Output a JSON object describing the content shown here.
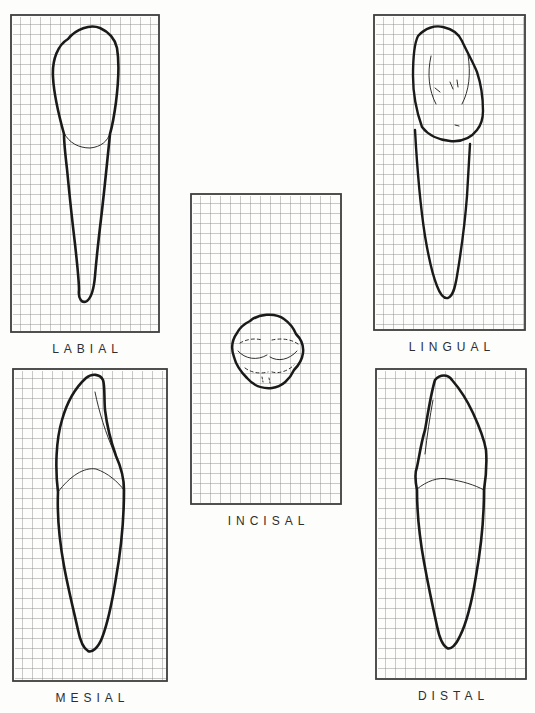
{
  "figure": {
    "background": "#fdfdfc",
    "ink_color": "#1a1a1a",
    "grid_color": "#7a7a7a",
    "border_color": "#3d3d3d",
    "cell_size": 10,
    "grid_stroke": 0.8,
    "border_stroke": 1.8
  },
  "panels": [
    {
      "id": "labial",
      "label": "LABIAL",
      "x": 10,
      "y": 14,
      "w": 150,
      "h": 319,
      "paths": [
        {
          "name": "tooth-outline",
          "d": "M 58 25 C 66 15 80 10 90 14 C 99 18 105 25 107 34 C 110 52 108 72 106 88 C 104 103 102 113 100 120 C 97 150 94 180 91 205 C 88 230 86 250 85 262 C 84 274 82 283 77 287 C 72 290 68 285 69 276 C 69 266 67 248 65 230 C 62 205 59 176 57 155 C 55 138 54 127 54 120 C 49 102 44 82 43 63 C 42 45 48 31 58 25 Z",
          "w": 2.6
        },
        {
          "name": "cervical-line",
          "d": "M 54 119 C 59 129 69 134 80 134 C 91 133 98 127 100 119",
          "w": 0.9
        }
      ]
    },
    {
      "id": "lingual",
      "label": "LINGUAL",
      "x": 373,
      "y": 14,
      "w": 153,
      "h": 317,
      "paths": [
        {
          "name": "crown-outline",
          "d": "M 45 22 C 52 14 62 11 70 13 C 79 15 86 20 89 27 C 94 38 100 48 104 58 C 108 70 110 85 110 97 C 110 104 108 111 104 116 C 98 124 88 128 77 127 C 66 126 55 121 49 113 C 44 99 40 80 40 62 C 40 44 41 30 45 22 Z",
          "w": 2.4
        },
        {
          "name": "root-outline",
          "d": "M 42 116 C 44 152 47 190 52 222 C 56 246 60 262 64 272 C 67 280 71 285 75 284 C 80 282 82 274 84 262 C 88 238 92 208 94 182 C 95 165 96 148 97 130",
          "w": 2.4
        },
        {
          "name": "mesial-marginal-ridge",
          "d": "M 58 42 C 54 60 56 77 63 90",
          "w": 0.9
        },
        {
          "name": "distal-marginal-ridge",
          "d": "M 95 41 C 98 60 96 77 89 90",
          "w": 0.9
        },
        {
          "name": "fossa-marks",
          "d": "M 77 68 L 80 75 M 84 66 L 85 73 M 62 74 L 67 78 M 82 111 L 86 112",
          "w": 0.9
        }
      ]
    },
    {
      "id": "incisal",
      "label": "INCISAL",
      "x": 190,
      "y": 193,
      "w": 152,
      "h": 312,
      "paths": [
        {
          "name": "incisal-outline",
          "d": "M 60 128 C 68 121 85 119 94 126 C 101 131 104 136 106 141 C 111 146 114 152 113 160 C 112 168 108 173 104 177 C 100 186 92 194 82 195 C 72 196 63 192 57 185 C 51 179 46 172 44 164 C 41 156 42 147 47 140 C 50 134 54 131 60 128 Z",
          "w": 2.5
        },
        {
          "name": "incisal-edge-hidden-left",
          "d": "M 50 150 C 57 146 65 145 72 147",
          "w": 0.9,
          "dash": "3 3"
        },
        {
          "name": "incisal-edge-hidden-right",
          "d": "M 82 147 C 91 145 101 146 108 151",
          "w": 0.9,
          "dash": "3 3"
        },
        {
          "name": "labial-ridge-left",
          "d": "M 48 158 C 55 166 67 168 77 162",
          "w": 0.9
        },
        {
          "name": "labial-ridge-right",
          "d": "M 80 164 C 88 169 99 167 107 158",
          "w": 0.9
        },
        {
          "name": "cingulum-hidden-left",
          "d": "M 55 175 C 62 180 70 181 78 179",
          "w": 0.9,
          "dash": "3 3"
        },
        {
          "name": "cingulum-hidden-right",
          "d": "M 82 179 C 89 181 98 178 104 172",
          "w": 0.9,
          "dash": "3 3"
        },
        {
          "name": "cingulum-hidden-ticks",
          "d": "M 72 184 L 73 189 M 79 185 L 80 190",
          "w": 0.9,
          "dash": "2 2"
        }
      ]
    },
    {
      "id": "mesial",
      "label": "MESIAL",
      "x": 12,
      "y": 368,
      "w": 156,
      "h": 314,
      "paths": [
        {
          "name": "tooth-outline",
          "d": "M 74 10 C 80 5 88 6 91 12 C 93 18 92 30 93 42 C 95 58 99 74 104 88 C 109 99 112 109 112 122 C 112 152 109 182 104 210 C 100 235 95 257 90 270 C 86 280 80 285 76 283 C 71 280 68 272 66 262 C 62 244 56 220 52 198 C 48 176 45 148 46 124 C 43 100 44 72 50 52 C 55 34 63 20 74 10 Z",
          "w": 2.6
        },
        {
          "name": "cervical-line",
          "d": "M 46 124 C 58 108 72 99 84 101 C 96 105 106 114 112 122",
          "w": 0.9
        },
        {
          "name": "lingual-contour-line",
          "d": "M 83 24 C 87 44 94 66 102 84",
          "w": 0.9
        }
      ]
    },
    {
      "id": "distal",
      "label": "DISTAL",
      "x": 375,
      "y": 368,
      "w": 152,
      "h": 312,
      "paths": [
        {
          "name": "tooth-outline",
          "d": "M 60 12 C 65 6 73 6 77 12 C 84 20 92 32 98 45 C 104 58 109 70 111 82 C 112 95 111 109 109 122 C 109 150 106 180 101 208 C 97 233 91 256 85 268 C 81 277 76 282 72 280 C 67 277 64 268 62 258 C 58 240 53 216 49 194 C 45 172 42 146 42 122 C 40 112 40 104 42 99 C 44 90 46 75 50 62 C 53 45 56 25 60 12 Z",
          "w": 2.6
        },
        {
          "name": "cervical-line",
          "d": "M 42 121 C 52 113 63 109 73 111 C 87 113 100 117 109 122",
          "w": 0.9
        },
        {
          "name": "lingual-contour-line",
          "d": "M 58 32 C 55 48 52 68 50 86",
          "w": 0.9
        }
      ]
    }
  ]
}
